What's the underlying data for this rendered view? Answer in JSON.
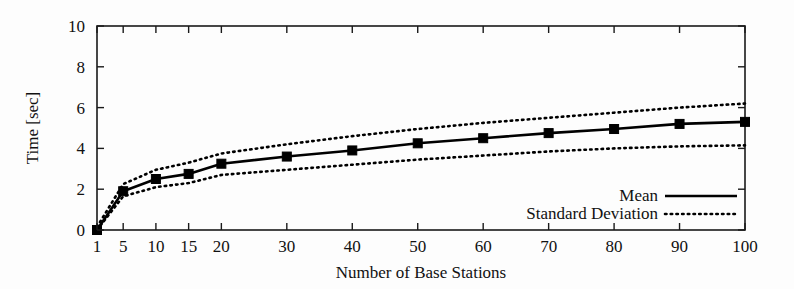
{
  "chart_data": {
    "type": "line",
    "title": "",
    "xlabel": "Number of Base Stations",
    "ylabel": "Time [sec]",
    "x": [
      1,
      5,
      10,
      15,
      20,
      30,
      40,
      50,
      60,
      70,
      80,
      90,
      100
    ],
    "xtick_labels": [
      "1",
      "5",
      "10",
      "15",
      "20",
      "30",
      "40",
      "50",
      "60",
      "70",
      "80",
      "90",
      "100"
    ],
    "ytick_labels": [
      "0",
      "2",
      "4",
      "6",
      "8",
      "10"
    ],
    "yticks": [
      0,
      2,
      4,
      6,
      8,
      10
    ],
    "xlim": [
      1,
      100
    ],
    "ylim": [
      0,
      10
    ],
    "grid": false,
    "legend_position": "bottom-right",
    "series": [
      {
        "name": "Mean",
        "style": "solid",
        "marker": "square",
        "values": [
          0.0,
          1.9,
          2.5,
          2.75,
          3.25,
          3.6,
          3.9,
          4.25,
          4.5,
          4.75,
          4.95,
          5.2,
          5.3
        ]
      },
      {
        "name": "Standard Deviation Upper",
        "style": "dotted",
        "marker": "none",
        "values": [
          0.15,
          2.25,
          2.95,
          3.3,
          3.75,
          4.2,
          4.6,
          4.95,
          5.25,
          5.5,
          5.75,
          6.0,
          6.2
        ]
      },
      {
        "name": "Standard Deviation Lower",
        "style": "dotted",
        "marker": "none",
        "values": [
          0.0,
          1.65,
          2.1,
          2.3,
          2.7,
          2.95,
          3.2,
          3.45,
          3.65,
          3.85,
          4.0,
          4.1,
          4.15
        ]
      }
    ],
    "legend": [
      {
        "label": "Mean",
        "style": "solid"
      },
      {
        "label": "Standard Deviation",
        "style": "dotted"
      }
    ],
    "colors": {
      "line": "#000000",
      "axis": "#1a1a1a",
      "background": "#fdfdfd"
    }
  }
}
